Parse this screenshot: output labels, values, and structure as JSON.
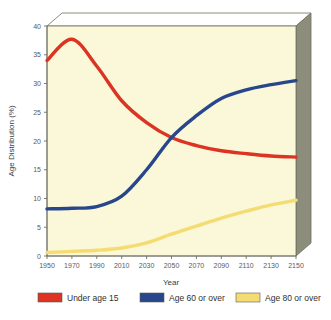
{
  "chart_data": {
    "type": "line",
    "title": "",
    "xlabel": "Year",
    "ylabel": "Age Distribution (%)",
    "xlim": [
      1950,
      2150
    ],
    "ylim": [
      0,
      40
    ],
    "grid": false,
    "legend_position": "bottom",
    "x": [
      1950,
      1970,
      1990,
      2010,
      2030,
      2050,
      2070,
      2090,
      2110,
      2130,
      2150
    ],
    "xticklabels": [
      "1950",
      "1970",
      "1990",
      "2010",
      "2030",
      "2050",
      "2070",
      "2090",
      "2110",
      "2130",
      "2150"
    ],
    "yticks": [
      0,
      5,
      10,
      15,
      20,
      25,
      30,
      35,
      40
    ],
    "yticklabels": [
      "0",
      "5",
      "10",
      "15",
      "20",
      "25",
      "30",
      "35",
      "40"
    ],
    "series": [
      {
        "name": "Under age 15",
        "color": "#DD3322",
        "values": [
          34.0,
          37.7,
          33.0,
          27.0,
          23.2,
          20.6,
          19.2,
          18.3,
          17.8,
          17.4,
          17.2
        ]
      },
      {
        "name": "Age 60 or over",
        "color": "#27468C",
        "values": [
          8.2,
          8.3,
          8.6,
          10.4,
          15.0,
          20.6,
          24.4,
          27.4,
          28.9,
          29.8,
          30.5
        ]
      },
      {
        "name": "Age 80 or over",
        "color": "#F5DC72",
        "values": [
          0.6,
          0.8,
          1.0,
          1.4,
          2.3,
          3.8,
          5.2,
          6.6,
          7.8,
          8.9,
          9.7
        ]
      }
    ]
  },
  "legend": {
    "items": [
      {
        "label": "Under age 15",
        "color": "#DD3322"
      },
      {
        "label": "Age 60 or over",
        "color": "#27468C"
      },
      {
        "label": "Age 80 or over",
        "color": "#F5DC72"
      }
    ]
  },
  "axes": {
    "x_title": "Year",
    "y_title": "Age Distribution (%)"
  },
  "colors": {
    "plot_background": "#FAF8D8",
    "wall_right": "#8D8D7C",
    "wall_top": "#FFFFFF",
    "frame_line": "#6E6E62",
    "page_background": "#FFFFFF"
  }
}
